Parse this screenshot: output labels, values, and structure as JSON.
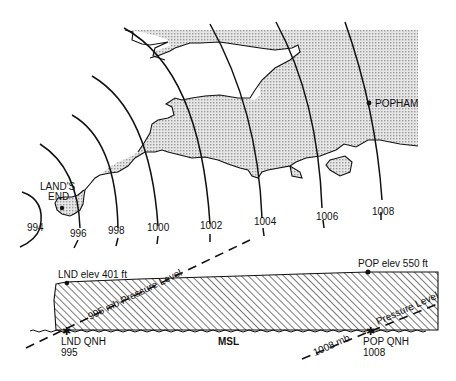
{
  "map": {
    "places": [
      {
        "name": "LAND'S END",
        "line1": "LAND'S",
        "line2": "END"
      },
      {
        "name": "POPHAM",
        "line1": "POPHAM"
      }
    ],
    "isobars": [
      "994",
      "996",
      "998",
      "1000",
      "1002",
      "1004",
      "1006",
      "1008"
    ]
  },
  "cross_section": {
    "lnd_elev": "LND elev 401 ft",
    "pop_elev": "POP elev 550 ft",
    "msl": "MSL",
    "lnd_qnh_label": "LND QNH",
    "lnd_qnh_value": "995",
    "pop_qnh_label": "POP QNH",
    "pop_qnh_value": "1008",
    "pressure_level_995": "995 mb Pressure Level",
    "pressure_level_1008_a": "1008 mb",
    "pressure_level_1008_b": "Pressure Level"
  },
  "colors": {
    "ink": "#111111",
    "land_fill": "#d4d4d4",
    "background": "#ffffff"
  }
}
